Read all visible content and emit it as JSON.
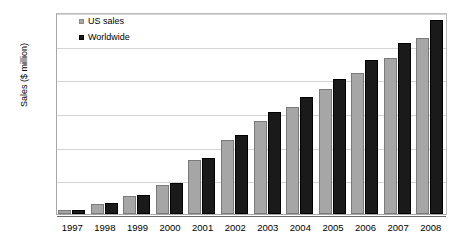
{
  "chart_data": {
    "type": "bar",
    "title": "",
    "subtitle": "",
    "xlabel": "",
    "ylabel": "Sales ($ million)",
    "categories": [
      "1997",
      "1998",
      "1999",
      "2000",
      "2001",
      "2002",
      "2003",
      "2004",
      "2005",
      "2006",
      "2007",
      "2008"
    ],
    "ylim": [
      0,
      3000
    ],
    "ytick_labels": [
      "3000",
      "2500",
      "2000",
      "1500",
      "1000",
      "500",
      "0"
    ],
    "ytick_values": [
      3000,
      2500,
      2000,
      1500,
      1000,
      500,
      0
    ],
    "grid": true,
    "legend_position": "top-left-inside",
    "series": [
      {
        "name": "US sales",
        "color": "#a6a6a6",
        "values": [
          60,
          150,
          265,
          435,
          795,
          1095,
          1385,
          1595,
          1860,
          2100,
          2320,
          2615
        ]
      },
      {
        "name": "Worldwide",
        "color": "#1a1a1a",
        "values": [
          60,
          160,
          285,
          455,
          835,
          1175,
          1510,
          1735,
          2010,
          2285,
          2545,
          2885
        ]
      }
    ]
  },
  "legend": {
    "items": [
      {
        "label": "US sales",
        "swatch": "gray-square-icon"
      },
      {
        "label": "Worldwide",
        "swatch": "black-square-icon"
      }
    ]
  }
}
